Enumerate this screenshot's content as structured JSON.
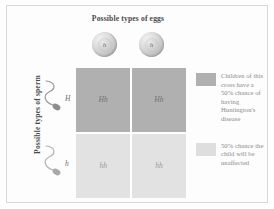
{
  "figure": {
    "title_eggs": "Possible types of eggs",
    "title_sperm": "Possible types of sperm"
  },
  "eggs": [
    {
      "label": "h",
      "name": "egg-gamete-1"
    },
    {
      "label": "h",
      "name": "egg-gamete-2"
    }
  ],
  "sperm": [
    {
      "label": "H",
      "name": "sperm-gamete-1"
    },
    {
      "label": "h",
      "name": "sperm-gamete-2"
    }
  ],
  "punnett": {
    "cells": [
      {
        "genotype": "Hh",
        "shade": "dark"
      },
      {
        "genotype": "Hh",
        "shade": "dark"
      },
      {
        "genotype": "hh",
        "shade": "light"
      },
      {
        "genotype": "hh",
        "shade": "light"
      }
    ]
  },
  "legend": [
    {
      "swatch": "dark",
      "text": "Children of this cross have a 50% chance of having Huntington's disease"
    },
    {
      "swatch": "light",
      "text": "50% chance the child will be unaffected"
    }
  ],
  "colors": {
    "dark_swatch": "#b0b0b0",
    "light_swatch": "#e2e2e2",
    "text": "#8a8a8a",
    "heading": "#4a4a4a",
    "frame": "#d8d8d8"
  }
}
